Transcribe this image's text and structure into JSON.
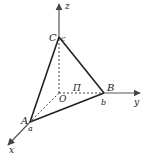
{
  "diagram": {
    "colors": {
      "axis": "#555555",
      "edge": "#222222",
      "dashed": "#444444",
      "text": "#222222"
    },
    "axes": {
      "x": {
        "label": "x"
      },
      "y": {
        "label": "y"
      },
      "z": {
        "label": "z"
      }
    },
    "points": {
      "origin": {
        "label": "O"
      },
      "A": {
        "label": "A",
        "intercept": "a"
      },
      "B": {
        "label": "B",
        "intercept": "b"
      },
      "C": {
        "label": "C",
        "intercept": "c"
      }
    },
    "plane": {
      "label": "Π"
    }
  }
}
